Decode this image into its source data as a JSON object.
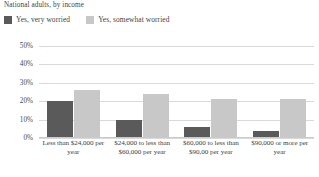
{
  "subtitle": "National adults, by income",
  "legend": {
    "position": "top-left",
    "items": [
      {
        "label": "Yes, very worried",
        "color": "#5a5a5a",
        "swatch_name": "legend-swatch-very-worried"
      },
      {
        "label": "Yes, somewhat worried",
        "color": "#c8c8c8",
        "swatch_name": "legend-swatch-somewhat-worried"
      }
    ]
  },
  "chart_data": {
    "type": "bar",
    "title": "",
    "subtitle": "National adults, by income",
    "xlabel": "",
    "ylabel": "",
    "ylim": [
      0,
      50
    ],
    "ytick_labels": [
      "50%",
      "40%",
      "30%",
      "20%",
      "10%",
      "0%"
    ],
    "ytick_values": [
      50,
      40,
      30,
      20,
      10,
      0
    ],
    "grid": true,
    "legend_position": "top-left",
    "categories": [
      "Less than $24,000 per year",
      "$24,000 to less than $60,000 per year",
      "$60,000 to less than $90,00 per year",
      "$90,000 or more per year"
    ],
    "series": [
      {
        "name": "Yes, very worried",
        "color": "#5a5a5a",
        "values": [
          20,
          10,
          6,
          4
        ]
      },
      {
        "name": "Yes, somewhat worried",
        "color": "#c8c8c8",
        "values": [
          26,
          24,
          21,
          21
        ]
      }
    ]
  }
}
